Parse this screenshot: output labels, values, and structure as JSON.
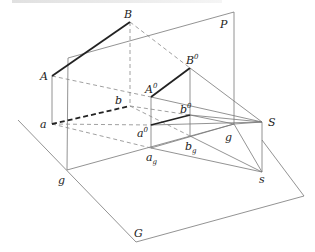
{
  "figure": {
    "type": "perspective-projection-diagram",
    "labels": {
      "B": "B",
      "A": "A",
      "P": "P",
      "B0": "B",
      "B0_sup": "0",
      "A0": "A",
      "A0_sup": "0",
      "b": "b",
      "b0": "b",
      "b0_sup": "0",
      "a": "a",
      "a0": "a",
      "a0_sup": "0",
      "S": "S",
      "g_right": "g",
      "g_left": "g",
      "ag": "a",
      "ag_sub": "g",
      "bg": "b",
      "bg_sub": "g",
      "s": "s",
      "G": "G"
    },
    "colors": {
      "thin_line": "#777777",
      "thick_line": "#222222",
      "text": "#222222"
    }
  }
}
